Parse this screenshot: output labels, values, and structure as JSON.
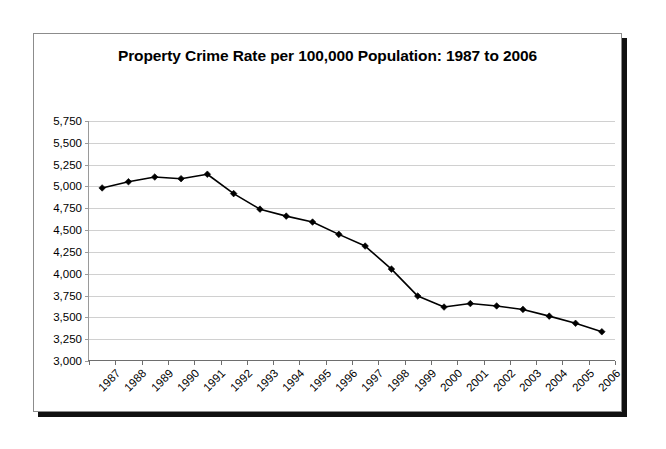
{
  "chart_data": {
    "type": "line",
    "title": "Property Crime Rate per 100,000 Population: 1987 to 2006",
    "xlabel": "",
    "ylabel": "",
    "categories": [
      "1987",
      "1988",
      "1989",
      "1990",
      "1991",
      "1992",
      "1993",
      "1994",
      "1995",
      "1996",
      "1997",
      "1998",
      "1999",
      "2000",
      "2001",
      "2002",
      "2003",
      "2004",
      "2005",
      "2006"
    ],
    "values": [
      4983,
      5054,
      5108,
      5089,
      5140,
      4918,
      4740,
      4660,
      4592,
      4451,
      4317,
      4053,
      3744,
      3618,
      3658,
      3631,
      3591,
      3514,
      3432,
      3335
    ],
    "ytick_labels": [
      "5,750",
      "5,500",
      "5,250",
      "5,000",
      "4,750",
      "4,500",
      "4,250",
      "4,000",
      "3,750",
      "3,500",
      "3,250",
      "3,000"
    ],
    "ytick_values": [
      5750,
      5500,
      5250,
      5000,
      4750,
      4500,
      4250,
      4000,
      3750,
      3500,
      3250,
      3000
    ],
    "ylim": [
      3000,
      5750
    ],
    "grid": true,
    "legend": "none",
    "marker": "diamond",
    "line_color": "#000000",
    "grid_color": "#d0d0d0",
    "background": "#ffffff"
  }
}
